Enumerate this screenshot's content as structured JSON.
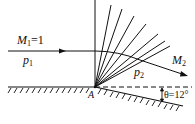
{
  "diagram": {
    "type": "prandtl-meyer-expansion-fan",
    "upstream": {
      "mach_symbol": "M",
      "mach_sub": "1",
      "mach_value": "=1",
      "pressure_symbol": "p",
      "pressure_sub": "1"
    },
    "downstream": {
      "mach_symbol": "M",
      "mach_sub": "2",
      "pressure_symbol": "p",
      "pressure_sub": "2"
    },
    "corner_label": "A",
    "angle_label": "θ=12°",
    "colors": {
      "line": "#111111",
      "background": "#ffffff"
    }
  }
}
